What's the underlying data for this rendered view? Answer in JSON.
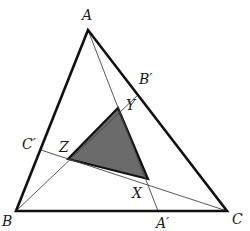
{
  "diagram": {
    "colors": {
      "outline": "#111111",
      "cevian": "#444444",
      "shade": "#6b6b6b",
      "label": "#1a1a1a"
    },
    "points": {
      "A": {
        "label": "A",
        "x": 88,
        "y": 30
      },
      "B": {
        "label": "B",
        "x": 16,
        "y": 211
      },
      "C": {
        "label": "C",
        "x": 227,
        "y": 211
      },
      "A_prime": {
        "label": "A′",
        "x": 158,
        "y": 211
      },
      "B_prime": {
        "label": "B′",
        "x": 139,
        "y": 94
      },
      "C_prime": {
        "label": "C′",
        "x": 41,
        "y": 150
      },
      "X": {
        "label": "X",
        "x": 148,
        "y": 179
      },
      "Y": {
        "label": "Y",
        "x": 118,
        "y": 108
      },
      "Z": {
        "label": "Z",
        "x": 68,
        "y": 159
      }
    },
    "labels": {
      "A": "A",
      "B": "B",
      "C": "C",
      "A_prime": "A′",
      "B_prime": "B′",
      "C_prime": "C′",
      "X": "X",
      "Y": "Y",
      "Z": "Z"
    }
  }
}
